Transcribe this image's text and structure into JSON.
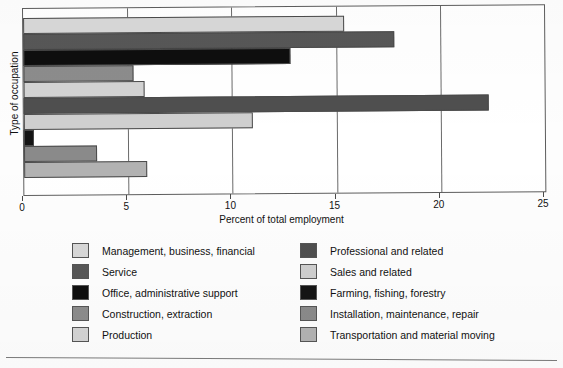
{
  "chart_data": {
    "type": "bar",
    "orientation": "horizontal",
    "title": "",
    "xlabel": "Percent of total employment",
    "ylabel": "Type of occupation",
    "xlim": [
      0,
      25
    ],
    "xticks": [
      0,
      5,
      10,
      15,
      20,
      25
    ],
    "xtick_labels": [
      "0",
      "5",
      "10",
      "15",
      "20",
      "25"
    ],
    "grid": true,
    "legend_position": "below",
    "legend_columns": 2,
    "categories": [
      "Management, business, financial",
      "Professional and related",
      "Office, administrative support",
      "Sales and related",
      "Production",
      "Service",
      "Construction, extraction",
      "Farming, fishing, forestry",
      "Installation, maintenance, repair",
      "Transportation and material moving"
    ],
    "values": [
      15.4,
      17.8,
      12.8,
      5.3,
      5.8,
      22.3,
      11.0,
      0.5,
      3.5,
      5.9
    ],
    "colors": [
      "#d8d8d8",
      "#575757",
      "#0e0e0e",
      "#8c8c8c",
      "#d3d3d3",
      "#4f4f4f",
      "#cfcfcf",
      "#141414",
      "#8a8a8a",
      "#b2b2b2"
    ]
  },
  "axis": {
    "x_title": "Percent of total employment",
    "y_title": "Type of occupation",
    "ticks": [
      {
        "label": "0",
        "value": 0
      },
      {
        "label": "5",
        "value": 5
      },
      {
        "label": "10",
        "value": 10
      },
      {
        "label": "15",
        "value": 15
      },
      {
        "label": "20",
        "value": 20
      },
      {
        "label": "25",
        "value": 25
      }
    ]
  },
  "legend": {
    "left_column": [
      {
        "label": "Management, business, financial",
        "color": "#d8d8d8"
      },
      {
        "label": "Service",
        "color": "#575757"
      },
      {
        "label": "Office, administrative support",
        "color": "#0e0e0e"
      },
      {
        "label": "Construction, extraction",
        "color": "#8c8c8c"
      },
      {
        "label": "Production",
        "color": "#d3d3d3"
      }
    ],
    "right_column": [
      {
        "label": "Professional and related",
        "color": "#4f4f4f"
      },
      {
        "label": "Sales and related",
        "color": "#cfcfcf"
      },
      {
        "label": "Farming, fishing, forestry",
        "color": "#141414"
      },
      {
        "label": "Installation, maintenance, repair",
        "color": "#8a8a8a"
      },
      {
        "label": "Transportation and material moving",
        "color": "#b2b2b2"
      }
    ]
  }
}
